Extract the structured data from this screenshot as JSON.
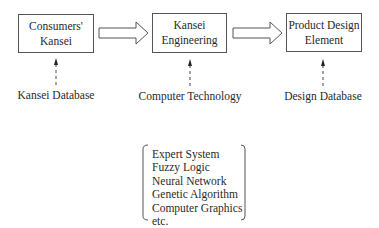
{
  "diagram": {
    "nodes": [
      {
        "id": "consumers-kansei",
        "line1": "Consumers'",
        "line2": "Kansei"
      },
      {
        "id": "kansei-engineering",
        "line1": "Kansei",
        "line2": "Engineering"
      },
      {
        "id": "product-design-element",
        "line1": "Product Design",
        "line2": "Element"
      }
    ],
    "inputs": [
      {
        "id": "kansei-database",
        "label": "Kansei Database"
      },
      {
        "id": "computer-technology",
        "label": "Computer Technology"
      },
      {
        "id": "design-database",
        "label": "Design Database"
      }
    ],
    "technologies": {
      "items": [
        "Expert System",
        "Fuzzy Logic",
        "Neural Network",
        "Genetic Algorithm",
        "Computer Graphics",
        "etc."
      ]
    },
    "colors": {
      "line": "#555555",
      "text": "#2a2a2a"
    }
  }
}
